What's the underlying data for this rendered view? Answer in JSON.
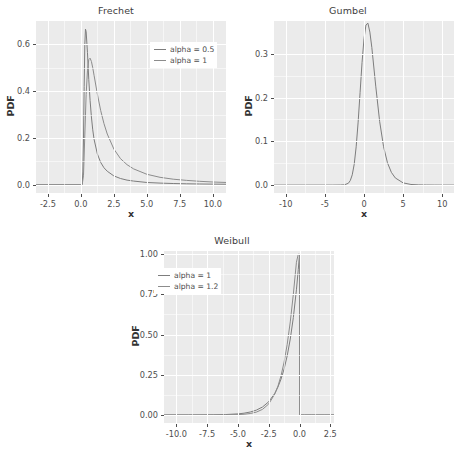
{
  "figure": {
    "background": "#ffffff",
    "panel_background": "#ebebeb",
    "grid_color": "#ffffff",
    "line_color_1": "#7d7d7d",
    "line_color_2": "#8c8c8c",
    "text_color": "#4d4d4d"
  },
  "chart_data": [
    {
      "type": "line",
      "title": "Frechet",
      "xlabel": "x",
      "ylabel": "PDF",
      "xlim": [
        -3.4,
        11.0
      ],
      "ylim": [
        -0.035,
        0.7
      ],
      "xticks": [
        "-2.5",
        "0.0",
        "2.5",
        "5.0",
        "7.5",
        "10.0"
      ],
      "xtick_values": [
        -2.5,
        0.0,
        2.5,
        5.0,
        7.5,
        10.0
      ],
      "yticks": [
        "0.0",
        "0.2",
        "0.4",
        "0.6"
      ],
      "ytick_values": [
        0.0,
        0.2,
        0.4,
        0.6
      ],
      "grid": true,
      "legend_position": "top-right",
      "legend": [
        "alpha = 0.5",
        "alpha = 1"
      ],
      "series": [
        {
          "name": "alpha = 0.5",
          "x": [
            -3.4,
            -0.02,
            0.0,
            0.05,
            0.1,
            0.15,
            0.2,
            0.25,
            0.3,
            0.35,
            0.4,
            0.5,
            0.6,
            0.7,
            0.8,
            0.9,
            1.0,
            1.25,
            1.5,
            1.75,
            2.0,
            2.5,
            3.0,
            3.5,
            4.0,
            5.0,
            6.0,
            7.0,
            8.0,
            9.0,
            10.0,
            11.0
          ],
          "y": [
            0.0,
            0.0,
            0.0,
            0.0,
            0.002,
            0.055,
            0.2,
            0.42,
            0.6,
            0.665,
            0.655,
            0.565,
            0.45,
            0.36,
            0.29,
            0.235,
            0.195,
            0.132,
            0.096,
            0.073,
            0.058,
            0.038,
            0.027,
            0.02,
            0.016,
            0.01,
            0.0073,
            0.0055,
            0.0043,
            0.0035,
            0.0029,
            0.0024
          ]
        },
        {
          "name": "alpha = 1",
          "x": [
            -3.4,
            -0.02,
            0.0,
            0.1,
            0.2,
            0.3,
            0.4,
            0.5,
            0.6,
            0.7,
            0.8,
            0.9,
            1.0,
            1.25,
            1.5,
            1.75,
            2.0,
            2.5,
            3.0,
            3.5,
            4.0,
            5.0,
            6.0,
            7.0,
            8.0,
            9.0,
            10.0,
            11.0
          ],
          "y": [
            0.0,
            0.0,
            0.0,
            0.0,
            0.041,
            0.213,
            0.385,
            0.487,
            0.535,
            0.541,
            0.527,
            0.5,
            0.468,
            0.388,
            0.318,
            0.262,
            0.217,
            0.153,
            0.112,
            0.086,
            0.068,
            0.045,
            0.032,
            0.024,
            0.019,
            0.015,
            0.012,
            0.01
          ]
        }
      ]
    },
    {
      "type": "line",
      "title": "Gumbel",
      "xlabel": "x",
      "ylabel": "PDF",
      "xlim": [
        -11.5,
        11.5
      ],
      "ylim": [
        -0.018,
        0.375
      ],
      "xticks": [
        "-10",
        "-5",
        "0",
        "5",
        "10"
      ],
      "xtick_values": [
        -10,
        -5,
        0,
        5,
        10
      ],
      "yticks": [
        "0.0",
        "0.1",
        "0.2",
        "0.3"
      ],
      "ytick_values": [
        0.0,
        0.1,
        0.2,
        0.3
      ],
      "grid": true,
      "legend_position": "none",
      "legend": [],
      "series": [
        {
          "name": "gumbel",
          "x": [
            -11.5,
            -6.0,
            -5.0,
            -4.0,
            -3.0,
            -2.5,
            -2.0,
            -1.75,
            -1.5,
            -1.25,
            -1.0,
            -0.75,
            -0.5,
            -0.25,
            0.0,
            0.25,
            0.5,
            0.75,
            1.0,
            1.5,
            2.0,
            2.5,
            3.0,
            3.5,
            4.0,
            5.0,
            6.0,
            7.0,
            8.0,
            9.0,
            10.0,
            11.5
          ],
          "y": [
            0.0,
            0.0,
            0.0,
            0.0,
            0.0002,
            0.0007,
            0.0042,
            0.0105,
            0.0236,
            0.0479,
            0.0875,
            0.144,
            0.2117,
            0.28,
            0.3345,
            0.366,
            0.37,
            0.3497,
            0.3144,
            0.2261,
            0.1456,
            0.0877,
            0.051,
            0.0291,
            0.0164,
            0.0051,
            0.0015,
            0.0005,
            0.0002,
            0.0001,
            3e-05,
            0.0
          ]
        }
      ]
    },
    {
      "type": "line",
      "title": "Weibull",
      "xlabel": "x",
      "ylabel": "PDF",
      "xlim": [
        -11.0,
        2.8
      ],
      "ylim": [
        -0.05,
        1.02
      ],
      "xticks": [
        "-10.0",
        "-7.5",
        "-5.0",
        "-2.5",
        "0.0",
        "2.5"
      ],
      "xtick_values": [
        -10.0,
        -7.5,
        -5.0,
        -2.5,
        0.0,
        2.5
      ],
      "yticks": [
        "0.00",
        "0.25",
        "0.50",
        "0.75",
        "1.00"
      ],
      "ytick_values": [
        0.0,
        0.25,
        0.5,
        0.75,
        1.0
      ],
      "grid": true,
      "legend_position": "top-left",
      "legend": [
        "alpha = 1",
        "alpha = 1.2"
      ],
      "series": [
        {
          "name": "alpha = 1",
          "x": [
            -11.0,
            -10.0,
            -9.0,
            -8.0,
            -7.0,
            -6.0,
            -5.0,
            -4.5,
            -4.0,
            -3.5,
            -3.0,
            -2.5,
            -2.0,
            -1.75,
            -1.5,
            -1.25,
            -1.0,
            -0.75,
            -0.5,
            -0.25,
            -0.1,
            -0.02,
            0.0,
            0.02,
            0.4,
            1.0,
            2.0,
            2.8
          ],
          "y": [
            2e-05,
            5e-05,
            0.00012,
            0.00034,
            0.0009,
            0.0025,
            0.0067,
            0.0111,
            0.0183,
            0.0302,
            0.0498,
            0.0821,
            0.1353,
            0.1738,
            0.2231,
            0.2865,
            0.3679,
            0.4724,
            0.6065,
            0.7788,
            0.9048,
            0.98,
            1.0,
            0.0,
            0.0,
            0.0,
            0.0,
            0.0
          ]
        },
        {
          "name": "alpha = 1.2",
          "x": [
            -11.0,
            -10.0,
            -9.0,
            -8.0,
            -7.0,
            -6.0,
            -5.0,
            -4.5,
            -4.0,
            -3.5,
            -3.0,
            -2.5,
            -2.0,
            -1.75,
            -1.5,
            -1.25,
            -1.0,
            -0.75,
            -0.5,
            -0.25,
            -0.1,
            -0.02,
            0.0,
            0.02,
            0.4,
            1.0,
            2.0,
            2.8
          ],
          "y": [
            0.0,
            0.0,
            0.0,
            0.0,
            0.0001,
            0.0005,
            0.0022,
            0.0045,
            0.009,
            0.0178,
            0.035,
            0.0683,
            0.131,
            0.1795,
            0.244,
            0.329,
            0.439,
            0.579,
            0.752,
            0.95,
            1.0,
            1.0,
            1.0,
            0.0,
            0.0,
            0.0,
            0.0,
            0.0
          ]
        }
      ]
    }
  ]
}
